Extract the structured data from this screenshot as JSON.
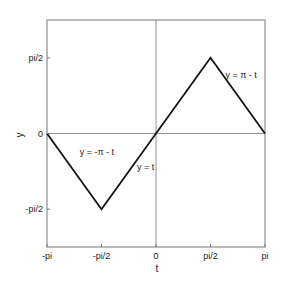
{
  "chart_data": {
    "type": "line",
    "title": "",
    "xlabel": "t",
    "ylabel": "y",
    "xlim": [
      -3.14159,
      3.14159
    ],
    "ylim": [
      -2.35619,
      2.35619
    ],
    "grid": false,
    "x_ticks": [
      {
        "value": -3.14159,
        "label": "-pi"
      },
      {
        "value": -1.5708,
        "label": "-pi/2"
      },
      {
        "value": 0,
        "label": "0"
      },
      {
        "value": 1.5708,
        "label": "pi/2"
      },
      {
        "value": 3.14159,
        "label": "pi"
      }
    ],
    "y_ticks": [
      {
        "value": -1.5708,
        "label": "-pi/2"
      },
      {
        "value": 0,
        "label": "0"
      },
      {
        "value": 1.5708,
        "label": "pi/2"
      }
    ],
    "reference_lines": [
      {
        "orientation": "horizontal",
        "value": 0
      },
      {
        "orientation": "vertical",
        "value": 0
      }
    ],
    "series": [
      {
        "name": "triangle wave",
        "x": [
          -3.14159,
          -1.5708,
          1.5708,
          3.14159
        ],
        "y": [
          0,
          -1.5708,
          1.5708,
          0
        ],
        "color": "#111111"
      }
    ],
    "annotations": [
      {
        "text": "y = -π - t",
        "x": -2.2,
        "y": -0.45
      },
      {
        "text": "y = t",
        "x": -0.55,
        "y": -0.75
      },
      {
        "text": "y = π - t",
        "x": 2.0,
        "y": 1.15
      }
    ]
  },
  "colors": {
    "line": "#111111",
    "axes": "#6e6e6e",
    "text": "#1a1a1a",
    "background": "#ffffff"
  }
}
